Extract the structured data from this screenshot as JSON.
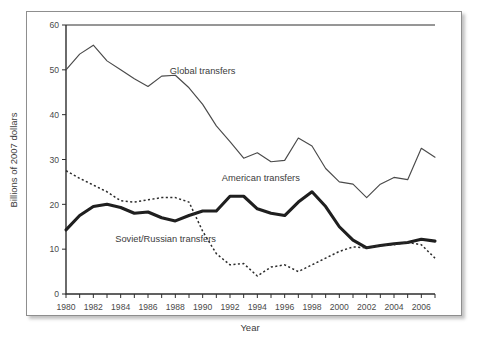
{
  "chart_data": {
    "type": "line",
    "title": "",
    "xlabel": "Year",
    "ylabel": "Billions of 2007 dollars",
    "xlim": [
      1980,
      2007
    ],
    "ylim": [
      0,
      60
    ],
    "yticks": [
      0,
      10,
      20,
      30,
      40,
      50,
      60
    ],
    "xticks": [
      1980,
      1981,
      1982,
      1983,
      1984,
      1985,
      1986,
      1987,
      1988,
      1989,
      1990,
      1991,
      1992,
      1993,
      1994,
      1995,
      1996,
      1997,
      1998,
      1999,
      2000,
      2001,
      2002,
      2003,
      2004,
      2005,
      2006,
      2007
    ],
    "xticklabels": [
      "1980",
      "1982",
      "1984",
      "1986",
      "1988",
      "1990",
      "1992",
      "1994",
      "1996",
      "1998",
      "2000",
      "2002",
      "2004",
      "2006"
    ],
    "grid": false,
    "legend_position": "inline-annotations",
    "x": [
      1980,
      1981,
      1982,
      1983,
      1984,
      1985,
      1986,
      1987,
      1988,
      1989,
      1990,
      1991,
      1992,
      1993,
      1994,
      1995,
      1996,
      1997,
      1998,
      1999,
      2000,
      2001,
      2002,
      2003,
      2004,
      2005,
      2006,
      2007
    ],
    "series": [
      {
        "name": "Global transfers",
        "style": "thin-solid",
        "color": "#4a4a4a",
        "values": [
          50.0,
          53.5,
          55.5,
          52.0,
          50.0,
          48.0,
          46.3,
          48.6,
          48.8,
          46.0,
          42.3,
          37.5,
          34.0,
          30.3,
          31.5,
          29.5,
          29.8,
          34.8,
          33.0,
          28.0,
          25.0,
          24.5,
          21.5,
          24.5,
          26.0,
          25.5,
          32.5,
          30.5
        ]
      },
      {
        "name": "American transfers",
        "style": "thick-solid",
        "color": "#1f1f1f",
        "values": [
          14.3,
          17.5,
          19.5,
          20.0,
          19.3,
          18.0,
          18.3,
          17.0,
          16.3,
          17.5,
          18.5,
          18.5,
          21.8,
          21.8,
          19.0,
          18.0,
          17.5,
          20.5,
          22.8,
          19.5,
          15.0,
          12.0,
          10.3,
          10.8,
          11.2,
          11.5,
          12.2,
          11.8
        ]
      },
      {
        "name": "Soviet/Russian transfers",
        "style": "dotted",
        "color": "#2b2b2b",
        "values": [
          27.5,
          25.8,
          24.3,
          22.8,
          20.8,
          20.5,
          21.0,
          21.5,
          21.5,
          20.5,
          14.0,
          9.0,
          6.5,
          6.8,
          4.0,
          6.0,
          6.5,
          5.0,
          6.5,
          8.0,
          9.5,
          10.5,
          10.3,
          10.8,
          11.0,
          11.5,
          11.0,
          8.0
        ]
      }
    ],
    "annotations": [
      {
        "text": "Global transfers",
        "x": 1987.6,
        "y": 49.0
      },
      {
        "text": "American transfers",
        "x": 1991.4,
        "y": 25.2
      },
      {
        "text": "Soviet/Russian transfers",
        "x": 1983.6,
        "y": 11.6
      }
    ]
  }
}
